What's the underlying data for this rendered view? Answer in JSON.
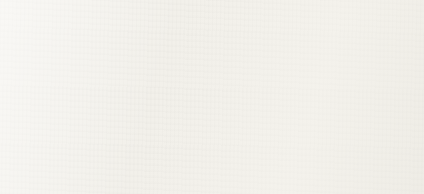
{
  "legend": {
    "items": [
      {
        "label": "FISCAL",
        "color": "#1c1c1c",
        "thickness": 3.0
      },
      {
        "label": "REGULATORY",
        "color": "#242424",
        "thickness": 3.0
      },
      {
        "label": "PERSONAL",
        "color": "#9a9a9a",
        "thickness": 2.8
      },
      {
        "label": "OVERALL",
        "color": "#111111",
        "thickness": 3.4
      }
    ]
  },
  "chart_data": {
    "type": "line",
    "title": "",
    "xlabel": "YEAR",
    "ylabel": "RANK",
    "xlim": [
      2000,
      2020
    ],
    "ylim": [
      1,
      50
    ],
    "y_inverted": true,
    "grid": true,
    "grid_style": "dotted-horizontal",
    "legend_position": "left",
    "xticks": [
      2000,
      2005,
      2010,
      2015,
      2020
    ],
    "xticklabels": [
      "2000",
      "2005",
      "2010",
      "2015",
      "2020"
    ],
    "yticks": [
      1,
      10,
      20,
      30,
      40,
      50
    ],
    "yticklabels": [
      "1",
      "10",
      "20",
      "30",
      "40",
      "50"
    ],
    "x": [
      2000,
      2001,
      2002,
      2003,
      2004,
      2005,
      2006,
      2007,
      2008,
      2009,
      2010,
      2011,
      2012,
      2013,
      2014,
      2015,
      2016,
      2017,
      2018,
      2019,
      2020
    ],
    "series": [
      {
        "name": "FISCAL",
        "color": "#1c1c1c",
        "width": 2.6,
        "values": [
          15,
          13,
          12,
          12,
          13,
          13,
          13,
          11,
          10,
          10,
          9,
          9,
          9,
          12,
          14,
          15,
          13,
          11,
          11,
          13,
          12
        ]
      },
      {
        "name": "REGULATORY",
        "color": "#242424",
        "width": 2.6,
        "values": [
          32,
          33,
          31,
          32,
          30,
          31,
          29,
          30,
          29,
          27,
          24,
          22,
          23,
          26,
          28,
          26,
          27,
          26,
          27,
          27,
          27
        ]
      },
      {
        "name": "PERSONAL",
        "color": "#9a9a9a",
        "width": 2.4,
        "values": [
          36,
          38,
          39,
          40,
          40,
          39,
          41,
          41,
          41,
          41,
          41,
          43,
          45,
          28,
          31,
          30,
          33,
          36,
          37,
          36,
          34
        ]
      },
      {
        "name": "OVERALL",
        "color": "#6d6d6d",
        "width": 2.6,
        "values": [
          40,
          38,
          39,
          39,
          38,
          37,
          38,
          36,
          35,
          34,
          31,
          29,
          29,
          32,
          33,
          33,
          33,
          34,
          35,
          34,
          33
        ]
      }
    ]
  }
}
